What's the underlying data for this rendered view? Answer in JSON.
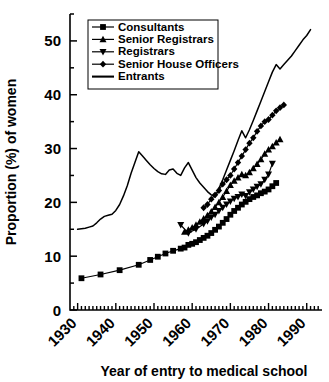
{
  "chart_data": {
    "type": "line",
    "title": "",
    "xlabel": "Year of entry to medical school",
    "ylabel": "Proportion (%) of women",
    "xlim": [
      1928,
      1994
    ],
    "ylim": [
      0,
      55
    ],
    "xticks": [
      1930,
      1940,
      1950,
      1960,
      1970,
      1980,
      1990
    ],
    "xticklabels": [
      "1930",
      "1940",
      "1950",
      "1960",
      "1970",
      "1980",
      "1990"
    ],
    "yticks": [
      0,
      10,
      20,
      30,
      40,
      50
    ],
    "yticklabels": [
      "0",
      "10",
      "20",
      "30",
      "40",
      "50"
    ],
    "minor_ytick_step": 5,
    "minor_xtick_step": 1,
    "grid": false,
    "legend_position": "top-left",
    "series": [
      {
        "name": "Consultants",
        "marker": "square",
        "x": [
          1931,
          1936,
          1941,
          1946,
          1949,
          1951,
          1953,
          1955,
          1957,
          1958,
          1959,
          1960,
          1961,
          1962,
          1963,
          1964,
          1965,
          1966,
          1967,
          1968,
          1969,
          1970,
          1971,
          1972,
          1973,
          1974,
          1975,
          1976,
          1977,
          1978,
          1979,
          1980,
          1981,
          1982
        ],
        "y": [
          5.9,
          6.6,
          7.4,
          8.4,
          9.3,
          9.9,
          10.5,
          11.0,
          11.4,
          11.6,
          12.1,
          12.3,
          12.6,
          13.0,
          13.4,
          13.8,
          14.3,
          14.9,
          15.5,
          16.2,
          16.9,
          17.7,
          18.4,
          19.0,
          19.6,
          20.1,
          20.6,
          21.0,
          21.3,
          21.7,
          22.0,
          22.4,
          23.0,
          23.6
        ]
      },
      {
        "name": "Senior Registrars",
        "marker": "triangle-up",
        "x": [
          1958,
          1959,
          1960,
          1961,
          1962,
          1963,
          1964,
          1965,
          1966,
          1967,
          1968,
          1969,
          1970,
          1971,
          1972,
          1973,
          1974,
          1975,
          1976,
          1977,
          1978,
          1979,
          1980,
          1981,
          1982,
          1983
        ],
        "y": [
          14.5,
          14.9,
          15.3,
          15.8,
          16.4,
          17.0,
          17.6,
          18.3,
          19.1,
          20.0,
          21.0,
          22.1,
          23.2,
          24.0,
          24.6,
          25.2,
          25.0,
          25.6,
          26.3,
          27.1,
          28.0,
          29.0,
          29.8,
          30.4,
          31.1,
          31.7
        ]
      },
      {
        "name": "Registrars",
        "marker": "triangle-down",
        "x": [
          1957,
          1959,
          1961,
          1963,
          1964,
          1965,
          1966,
          1967,
          1968,
          1969,
          1970,
          1971,
          1972,
          1973,
          1974,
          1975,
          1976,
          1977,
          1978,
          1979,
          1980,
          1981
        ],
        "y": [
          15.8,
          14.3,
          15.0,
          16.0,
          16.5,
          17.2,
          17.7,
          18.4,
          19.0,
          19.6,
          20.2,
          20.7,
          21.0,
          21.5,
          21.2,
          21.9,
          22.4,
          22.9,
          23.4,
          24.2,
          25.2,
          27.2
        ]
      },
      {
        "name": "Senior House Officers",
        "marker": "diamond",
        "x": [
          1963,
          1964,
          1965,
          1966,
          1967,
          1968,
          1969,
          1970,
          1971,
          1972,
          1973,
          1974,
          1975,
          1976,
          1977,
          1978,
          1979,
          1980,
          1981,
          1982,
          1983,
          1984
        ],
        "y": [
          19.0,
          19.6,
          20.6,
          21.4,
          22.2,
          23.4,
          24.2,
          25.0,
          26.2,
          27.4,
          28.6,
          29.8,
          31.0,
          32.0,
          33.2,
          34.2,
          35.0,
          35.4,
          36.2,
          37.0,
          37.6,
          38.1
        ]
      },
      {
        "name": "Entrants",
        "marker": "none",
        "x": [
          1930,
          1931,
          1932,
          1933,
          1934,
          1935,
          1936,
          1937,
          1938,
          1939,
          1940,
          1941,
          1942,
          1943,
          1944,
          1945,
          1946,
          1947,
          1948,
          1949,
          1950,
          1951,
          1952,
          1953,
          1954,
          1955,
          1956,
          1957,
          1958,
          1959,
          1960,
          1961,
          1962,
          1963,
          1964,
          1965,
          1966,
          1967,
          1968,
          1969,
          1970,
          1971,
          1972,
          1973,
          1974,
          1975,
          1976,
          1977,
          1978,
          1979,
          1980,
          1981,
          1982,
          1983,
          1984,
          1985,
          1986,
          1987,
          1988,
          1989,
          1990,
          1991
        ],
        "y": [
          15.0,
          15.1,
          15.2,
          15.4,
          15.6,
          16.2,
          16.9,
          17.4,
          17.6,
          17.8,
          18.5,
          19.6,
          21.2,
          23.1,
          25.4,
          27.4,
          29.4,
          28.6,
          27.8,
          27.0,
          26.3,
          25.7,
          25.3,
          25.2,
          26.0,
          26.2,
          25.4,
          25.0,
          26.4,
          27.4,
          26.0,
          24.6,
          23.6,
          22.8,
          22.0,
          21.4,
          21.0,
          22.6,
          24.2,
          26.0,
          27.8,
          29.6,
          31.5,
          33.3,
          32.0,
          33.5,
          35.2,
          37.0,
          38.8,
          40.6,
          42.4,
          44.2,
          45.6,
          44.8,
          45.6,
          46.4,
          47.2,
          48.2,
          49.2,
          50.2,
          51.0,
          52.1
        ]
      }
    ]
  },
  "colors": {
    "line": "#000000",
    "axis": "#000000",
    "background": "#ffffff"
  }
}
